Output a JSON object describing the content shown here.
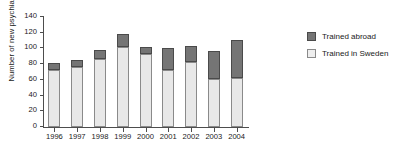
{
  "chart_data": {
    "type": "bar",
    "stacked": true,
    "title": "",
    "xlabel": "",
    "ylabel": "Number of new psychiatrists",
    "ylim": [
      0,
      140
    ],
    "ytick_values": [
      0,
      20,
      40,
      60,
      80,
      100,
      120,
      140
    ],
    "ytick_labels": [
      "0",
      "20",
      "40",
      "60",
      "80",
      "100",
      "120",
      "140"
    ],
    "grid": false,
    "legend_position": "right",
    "categories": [
      "1996",
      "1997",
      "1998",
      "1999",
      "2000",
      "2001",
      "2002",
      "2003",
      "2004"
    ],
    "series": [
      {
        "name": "Trained in Sweden",
        "color": "#e8e8e8",
        "values": [
          73,
          77,
          87,
          102,
          93,
          72,
          83,
          61,
          62
        ]
      },
      {
        "name": "Trained abroad",
        "color": "#757575",
        "values": [
          8,
          8,
          11,
          16,
          9,
          28,
          20,
          36,
          49
        ]
      }
    ],
    "totals": [
      81,
      85,
      98,
      118,
      102,
      100,
      103,
      97,
      111
    ]
  },
  "legend": {
    "items": [
      {
        "label": "Trained abroad",
        "swatch": "abroad"
      },
      {
        "label": "Trained in Sweden",
        "swatch": "sweden"
      }
    ]
  }
}
